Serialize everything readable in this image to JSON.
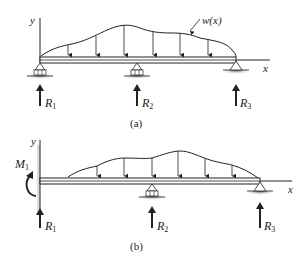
{
  "diagram_a": {
    "caption": "(a)",
    "y_axis_label": "y",
    "x_axis_label": "x",
    "load_label": "w(x)",
    "reactions": [
      {
        "name": "R",
        "sub": "1"
      },
      {
        "name": "R",
        "sub": "2"
      },
      {
        "name": "R",
        "sub": "3"
      }
    ],
    "supports": [
      "roller",
      "roller",
      "pin"
    ]
  },
  "diagram_b": {
    "caption": "(b)",
    "y_axis_label": "y",
    "x_axis_label": "x",
    "moment": {
      "name": "M",
      "sub": "1"
    },
    "reactions": [
      {
        "name": "R",
        "sub": "1"
      },
      {
        "name": "R",
        "sub": "2"
      },
      {
        "name": "R",
        "sub": "3"
      }
    ],
    "supports": [
      "fixed-wall",
      "roller",
      "pin"
    ]
  },
  "colors": {
    "line": "#222222",
    "support_shadow": "#9a9a9a"
  }
}
